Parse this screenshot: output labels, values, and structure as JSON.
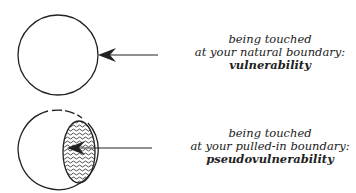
{
  "colors": {
    "stroke": "#222222",
    "background": "#ffffff"
  },
  "panels": [
    {
      "id": "natural",
      "caption_line1": "being touched",
      "caption_line2": "at your natural boundary:",
      "term": "vulnerability",
      "icon": "circle-with-arrow-at-edge"
    },
    {
      "id": "pulled-in",
      "caption_line1": "being touched",
      "caption_line2": "at your pulled-in boundary:",
      "term": "pseudovulnerability",
      "icon": "circle-with-hatched-inner-region-and-arrow"
    }
  ]
}
